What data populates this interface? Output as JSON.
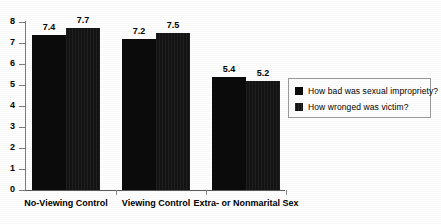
{
  "chart_data": {
    "type": "bar",
    "title": "",
    "xlabel": "",
    "ylabel": "",
    "ylim": [
      0,
      8
    ],
    "yticks": [
      "0",
      "1",
      "2",
      "3",
      "4",
      "5",
      "6",
      "7",
      "8"
    ],
    "grid": false,
    "legend_position": "right",
    "categories": [
      "No-Viewing Control",
      "Viewing Control",
      "Extra- or Nonmarital Sex"
    ],
    "series": [
      {
        "name": "How bad was sexual impropriety?",
        "color": "#0b0b0b",
        "values": [
          7.4,
          7.2,
          5.4
        ],
        "labels": [
          "7.4",
          "7.2",
          "5.4"
        ]
      },
      {
        "name": "How wronged was victim?",
        "color": "#131313",
        "values": [
          7.7,
          7.5,
          5.2
        ],
        "labels": [
          "7.7",
          "7.5",
          "5.2"
        ]
      }
    ]
  },
  "legend": {
    "items": [
      {
        "label": "How bad was sexual impropriety?"
      },
      {
        "label": "How wronged was victim?"
      }
    ]
  }
}
